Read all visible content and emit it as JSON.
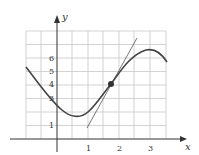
{
  "figure": {
    "axis_labels": {
      "x": "x",
      "y": "y"
    },
    "x_ticks": [
      {
        "label": "1",
        "value": 1
      },
      {
        "label": "2",
        "value": 2
      },
      {
        "label": "3",
        "value": 3
      }
    ],
    "y_ticks": [
      {
        "label": "1",
        "value": 1
      },
      {
        "label": "3",
        "value": 3
      },
      {
        "label": "4",
        "value": 4
      },
      {
        "label": "5",
        "value": 5
      },
      {
        "label": "6",
        "value": 6
      }
    ],
    "point": {
      "x": 1.75,
      "y": 4
    },
    "colors": {
      "curve": "#444444",
      "grid": "#c8c8c8",
      "axis": "#333333",
      "tangent": "#555555"
    }
  }
}
